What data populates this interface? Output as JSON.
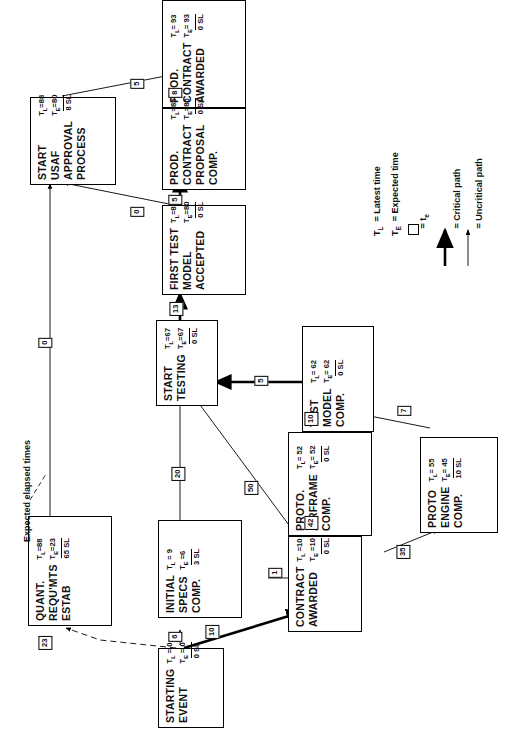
{
  "diagram": {
    "type": "pert-network",
    "orientation": "rotated-90-ccw",
    "caption": "Expected elapsed times"
  },
  "legend": {
    "items": [
      {
        "symbol": "T_L",
        "eq": "=",
        "label": "Latest time"
      },
      {
        "symbol": "T_E",
        "eq": "=",
        "label": "Expected time"
      },
      {
        "symbol": "box",
        "eq": "=",
        "label": "te"
      },
      {
        "symbol": "thick-arrow",
        "eq": "=",
        "label": "Critical path"
      },
      {
        "symbol": "thin-arrow",
        "eq": "=",
        "label": "Uncritical path"
      }
    ],
    "tl_text": "T",
    "tl_sub": "L",
    "te_text": "T",
    "te_sub": "E",
    "latest_time": "Latest time",
    "expected_time": "Expected time",
    "te_small": "t",
    "te_small_sub": "e",
    "critical_path": "Critical path",
    "uncritical_path": "Uncritical path",
    "eq": "="
  },
  "nodes": [
    {
      "id": "prod-contract-awarded",
      "lines": [
        "PROD.",
        "CONTRACT",
        "AWARDED"
      ],
      "tl": "T_L= 93",
      "te": "T_E= 93",
      "slack": "0 SL"
    },
    {
      "id": "start-usaf-approval",
      "lines": [
        "START",
        "USAF",
        "APPROVAL",
        "PROCESS"
      ],
      "tl": "T_L=88",
      "te": "T_E=80",
      "slack": "8 SL"
    },
    {
      "id": "prod-contract-proposal-comp",
      "lines": [
        "PROD.",
        "CONTRACT",
        "PROPOSAL",
        "COMP."
      ],
      "tl": "T_L=85",
      "te": "T_E=85",
      "slack": "0 SL"
    },
    {
      "id": "first-test-model-accepted",
      "lines": [
        "FIRST TEST",
        "MODEL",
        "ACCEPTED"
      ],
      "tl": "T_L=80",
      "te": "T_E=80",
      "slack": "0 SL"
    },
    {
      "id": "start-testing",
      "lines": [
        "START",
        "TESTING"
      ],
      "tl": "T_L=67",
      "te": "T_E=67",
      "slack": "0 SL"
    },
    {
      "id": "test-model-comp",
      "lines": [
        "TEST",
        "MODEL",
        "COMP."
      ],
      "tl": "T_L= 62",
      "te": "T_E= 62",
      "slack": "0 SL"
    },
    {
      "id": "proto-airframe-comp",
      "lines": [
        "PROTO.",
        "AIRFRAME",
        "COMP."
      ],
      "tl": "T_L= 52",
      "te": "T_E= 52",
      "slack": "0 SL"
    },
    {
      "id": "proto-engine-comp",
      "lines": [
        "PROTO",
        "ENGINE",
        "COMP."
      ],
      "tl": "T_L= 55",
      "te": "T_E= 45",
      "slack": "10 SL"
    },
    {
      "id": "quant-requmts-estab",
      "lines": [
        "QUANT.",
        "REQU'MTS",
        "ESTAB"
      ],
      "tl": "T_L=88",
      "te": "T_E=23",
      "slack": "65 SL"
    },
    {
      "id": "initial-specs-comp",
      "lines": [
        "INITIAL",
        "SPECS",
        "COMP."
      ],
      "tl": "T_L = 9",
      "te": "T_E =6",
      "slack": "3 SL"
    },
    {
      "id": "contract-awarded",
      "lines": [
        "CONTRACT",
        "AWARDED"
      ],
      "tl": "T_L =10",
      "te": "T_E =10",
      "slack": "0 SL"
    },
    {
      "id": "starting-event",
      "lines": [
        "STARTING",
        "EVENT"
      ],
      "tl": "T_L = 0",
      "te": "T_E = 0",
      "slack": "0 SL"
    }
  ],
  "node_text": {
    "prod_contract_awarded": {
      "l1": "PROD.",
      "l2": "CONTRACT",
      "l3": "AWARDED",
      "tlv": "93",
      "tev": "93",
      "slack": "0 SL"
    },
    "start_usaf_approval": {
      "l1": "START",
      "l2": "USAF",
      "l3": "APPROVAL",
      "l4": "PROCESS",
      "tlv": "88",
      "tev": "80",
      "slack": "8 SL"
    },
    "prod_contract_proposal": {
      "l1": "PROD.",
      "l2": "CONTRACT",
      "l3": "PROPOSAL",
      "l4": "COMP.",
      "tlv": "85",
      "tev": "85",
      "slack": "0 SL"
    },
    "first_test_model": {
      "l1": "FIRST TEST",
      "l2": "MODEL",
      "l3": "ACCEPTED",
      "tlv": "80",
      "tev": "80",
      "slack": "0 SL"
    },
    "start_testing": {
      "l1": "START",
      "l2": "TESTING",
      "tlv": "67",
      "tev": "67",
      "slack": "0 SL"
    },
    "test_model_comp": {
      "l1": "TEST",
      "l2": "MODEL",
      "l3": "COMP.",
      "tlv": "62",
      "tev": "62",
      "slack": "0 SL"
    },
    "proto_airframe_comp": {
      "l1": "PROTO.",
      "l2": "AIRFRAME",
      "l3": "COMP.",
      "tlv": "52",
      "tev": "52",
      "slack": "0 SL"
    },
    "proto_engine_comp": {
      "l1": "PROTO",
      "l2": "ENGINE",
      "l3": "COMP.",
      "tlv": "55",
      "tev": "45",
      "slack": "10 SL"
    },
    "quant_requmts_estab": {
      "l1": "QUANT.",
      "l2": "REQU'MTS",
      "l3": "ESTAB",
      "tlv": "88",
      "tev": "23",
      "slack": "65 SL"
    },
    "initial_specs_comp": {
      "l1": "INITIAL",
      "l2": "SPECS",
      "l3": "COMP.",
      "tlv": "9",
      "tev": "6",
      "slack": "3 SL"
    },
    "contract_awarded": {
      "l1": "CONTRACT",
      "l2": "AWARDED",
      "tlv": "10",
      "tev": "10",
      "slack": "0 SL"
    },
    "starting_event": {
      "l1": "STARTING",
      "l2": "EVENT",
      "tlv": "0",
      "tev": "0",
      "slack": "0 SL"
    }
  },
  "edge_labels": {
    "awarded_from_proposal": "8",
    "awarded_from_usaf": "5",
    "proposal_from_firsttest": "5",
    "usaf_from_firsttest": "0",
    "usaf_from_quant": "0",
    "firsttest_from_starttesting": "13",
    "starttesting_from_testmodel": "5",
    "starttesting_from_specs": "20",
    "starttesting_from_contract": "50",
    "testmodel_from_airframe": "10",
    "testmodel_from_engine": "7",
    "airframe_from_contract": "42",
    "engine_from_contract": "35",
    "contract_from_specs": "1",
    "contract_from_start": "10",
    "specs_from_start": "6",
    "quant_from_start": "23"
  },
  "symbols": {
    "tl_prefix": "T",
    "tl_sub": "L",
    "te_prefix": "T",
    "te_sub": "E",
    "equals": "="
  }
}
